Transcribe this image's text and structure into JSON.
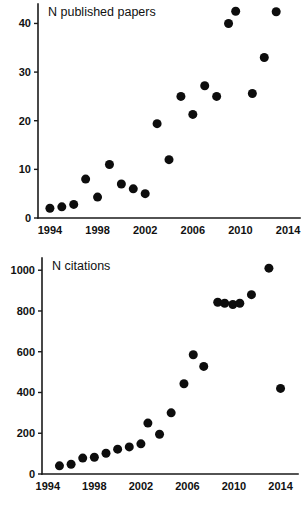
{
  "figure": {
    "name": "publications-and-citations-scatter-figure",
    "background_color": "#ffffff",
    "marker_color": "#0d0d0d",
    "axis_color": "#1a1a1a"
  },
  "chart_data": [
    {
      "type": "scatter",
      "id": "published-papers",
      "title": "N published papers",
      "xlabel": "",
      "ylabel": "",
      "xlim": [
        1993,
        2015
      ],
      "ylim": [
        0,
        44
      ],
      "grid": false,
      "legend": null,
      "xticks": [
        1994,
        1998,
        2002,
        2006,
        2010,
        2014
      ],
      "xtick_labels": [
        "1994",
        "1998",
        "2002",
        "2006",
        "2010",
        "2014"
      ],
      "yticks": [
        0,
        10,
        20,
        30,
        40
      ],
      "ytick_labels": [
        "0",
        "10",
        "20",
        "30",
        "40"
      ],
      "x": [
        1994,
        1995,
        1996,
        1997,
        1998,
        1999,
        2000,
        2001,
        2002,
        2003,
        2004,
        2005,
        2006,
        2007,
        2008,
        2009,
        2009.6,
        2011,
        2012,
        2013
      ],
      "values": [
        2,
        2.3,
        2.8,
        8,
        4.3,
        11,
        7,
        6,
        5,
        19.4,
        12,
        25,
        21.3,
        27.2,
        25,
        40,
        42.5,
        25.6,
        33,
        42.4
      ],
      "marker": "circle",
      "marker_size": 9
    },
    {
      "type": "scatter",
      "id": "citations",
      "title": "N citations",
      "xlabel": "",
      "ylabel": "",
      "xlim": [
        1993.5,
        2015.5
      ],
      "ylim": [
        0,
        1060
      ],
      "grid": false,
      "legend": null,
      "xticks": [
        1994,
        1998,
        2002,
        2006,
        2010,
        2014
      ],
      "xtick_labels": [
        "1994",
        "1998",
        "2002",
        "2006",
        "2010",
        "2014"
      ],
      "yticks": [
        0,
        200,
        400,
        600,
        800,
        1000
      ],
      "ytick_labels": [
        "0",
        "200",
        "400",
        "600",
        "800",
        "1000"
      ],
      "x": [
        1995,
        1996,
        1997,
        1998,
        1999,
        2000,
        2001,
        2002,
        2002.6,
        2003.6,
        2004.6,
        2005.7,
        2006.5,
        2007.4,
        2008.6,
        2009.2,
        2009.9,
        2010.5,
        2011.5,
        2013,
        2014
      ],
      "values": [
        40,
        48,
        78,
        82,
        102,
        122,
        133,
        148,
        250,
        195,
        300,
        443,
        585,
        528,
        843,
        838,
        832,
        838,
        880,
        1010,
        420
      ],
      "marker": "circle",
      "marker_size": 9
    }
  ],
  "panels": [
    {
      "name": "papers-panel",
      "title": "N published papers"
    },
    {
      "name": "citations-panel",
      "title": "N citations"
    }
  ]
}
